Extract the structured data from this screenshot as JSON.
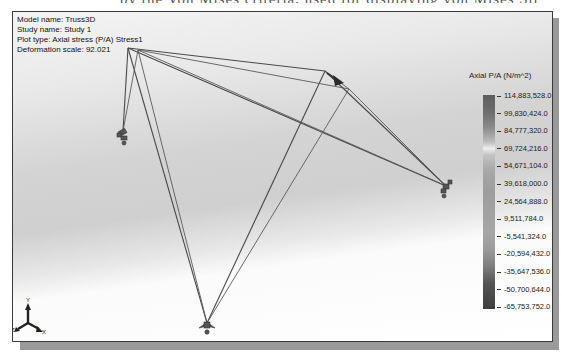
{
  "window": {
    "top_cut_text": "by the Von Mises criteria, used for displaying von Mises Stress."
  },
  "plot_info": {
    "model_name": "Model name: Truss3D",
    "study_name": "Study name: Study 1",
    "plot_type": "Plot type: Axial stress (P/A) Stress1",
    "deformation_scale": "Deformation scale: 92.021"
  },
  "legend": {
    "title": "Axial P/A (N/m^2)",
    "values": [
      "114,883,528.0",
      "99,830,424.0",
      "84,777,320.0",
      "69,724,216.0",
      "54,671,104.0",
      "39,618,000.0",
      "24,564,888.0",
      "9,511,784.0",
      "-5,541,324.0",
      "-20,594,432.0",
      "-35,647,536.0",
      "-50,700,644.0",
      "-65,753,752.0"
    ]
  },
  "triad": {
    "x_label": "X",
    "y_label": "Y",
    "z_label": "Z"
  },
  "icons": {
    "supports": [
      "fixed-support-icon-left",
      "fixed-support-icon-right",
      "fixed-support-icon-bottom"
    ],
    "load": "force-arrow-icon",
    "triad": "axis-triad-icon"
  }
}
